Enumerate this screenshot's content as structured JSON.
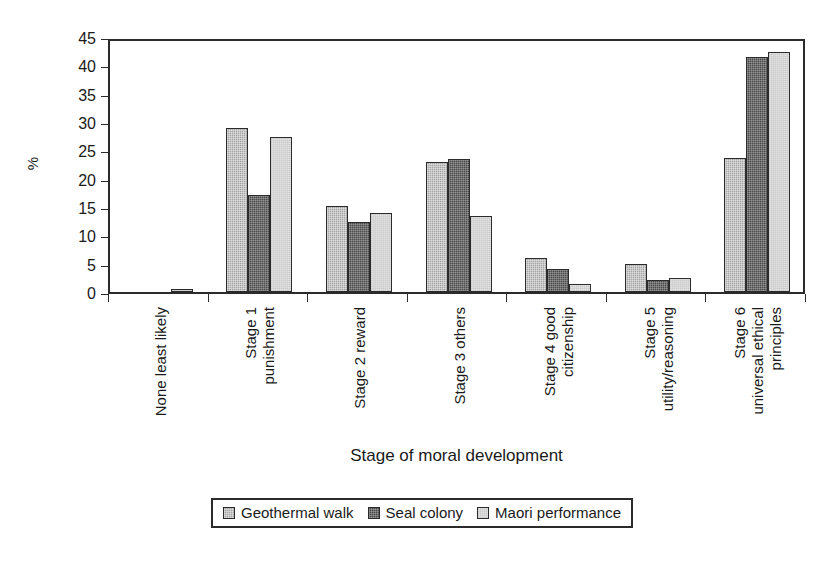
{
  "chart_data": {
    "type": "bar",
    "title": "",
    "xlabel": "Stage of moral development",
    "ylabel": "%",
    "ylim": [
      0,
      45
    ],
    "yticks": [
      0,
      5,
      10,
      15,
      20,
      25,
      30,
      35,
      40,
      45
    ],
    "grid": false,
    "legend_position": "bottom",
    "categories": [
      "None least likely",
      "Stage 1 punishment",
      "Stage 2 reward",
      "Stage 3 others",
      "Stage 4 good citizenship",
      "Stage 5 utility/reasoning",
      "Stage 6 universal ethical principles"
    ],
    "category_lines": [
      [
        "None least likely"
      ],
      [
        "Stage 1",
        "punishment"
      ],
      [
        "Stage 2 reward"
      ],
      [
        "Stage 3 others"
      ],
      [
        "Stage 4 good",
        "citizenship"
      ],
      [
        "Stage 5",
        "utility/reasoning"
      ],
      [
        "Stage 6",
        "universal ethical",
        "principles"
      ]
    ],
    "series": [
      {
        "name": "Geothermal walk",
        "color": "#a5a5a5",
        "values": [
          0,
          28.9,
          15.2,
          22.9,
          6.0,
          4.9,
          23.7
        ]
      },
      {
        "name": "Seal colony",
        "color": "#4b4b4b",
        "values": [
          0,
          17.2,
          12.3,
          23.5,
          4.1,
          2.1,
          41.4
        ]
      },
      {
        "name": "Maori performance",
        "color": "#e2e2e2",
        "values": [
          0.6,
          27.3,
          13.9,
          13.5,
          1.4,
          2.5,
          42.4
        ]
      }
    ]
  }
}
